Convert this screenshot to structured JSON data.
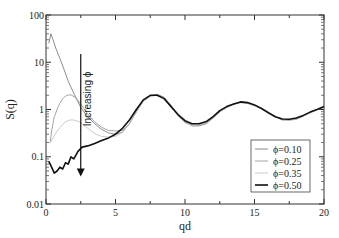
{
  "chart_data": {
    "type": "line",
    "title": "",
    "xlabel": "qd",
    "ylabel": "S(q)",
    "xlim": [
      0,
      20
    ],
    "ylim": [
      0.01,
      100
    ],
    "yscale": "log",
    "grid": false,
    "x_ticks": [
      0,
      5,
      10,
      15,
      20
    ],
    "x_tick_labels": [
      "0",
      "5",
      "10",
      "15",
      "20"
    ],
    "y_ticks": [
      0.01,
      0.1,
      1,
      10,
      100
    ],
    "y_tick_labels": [
      "0.01",
      "0.1",
      "1",
      "10",
      "100"
    ],
    "legend_position": "bottom-right",
    "annotation": {
      "text": "Increasing ϕ",
      "arrow_x": 2.5,
      "arrow_from": 15,
      "arrow_to": 0.04
    },
    "series": [
      {
        "name": "ϕ=0.10",
        "color": "#808080",
        "points": [
          [
            0.2,
            25
          ],
          [
            0.35,
            40
          ],
          [
            0.5,
            30
          ],
          [
            0.7,
            20
          ],
          [
            1.0,
            12
          ],
          [
            1.3,
            7
          ],
          [
            1.6,
            4
          ],
          [
            2.0,
            2.2
          ],
          [
            2.5,
            1.1
          ],
          [
            3.0,
            0.7
          ],
          [
            3.5,
            0.5
          ],
          [
            4.0,
            0.38
          ],
          [
            4.5,
            0.32
          ],
          [
            5.0,
            0.3
          ],
          [
            5.5,
            0.33
          ],
          [
            6.0,
            0.5
          ],
          [
            6.5,
            0.9
          ],
          [
            7.0,
            1.5
          ],
          [
            7.5,
            1.95
          ],
          [
            8.0,
            2.1
          ],
          [
            8.5,
            1.8
          ],
          [
            9.0,
            1.2
          ],
          [
            9.5,
            0.75
          ],
          [
            10.0,
            0.55
          ],
          [
            10.5,
            0.45
          ],
          [
            11.0,
            0.45
          ],
          [
            11.5,
            0.5
          ],
          [
            12.0,
            0.65
          ],
          [
            12.5,
            0.9
          ],
          [
            13.0,
            1.1
          ],
          [
            13.5,
            1.3
          ],
          [
            14.0,
            1.45
          ],
          [
            14.5,
            1.35
          ],
          [
            15.0,
            1.25
          ],
          [
            15.5,
            1.05
          ],
          [
            16.0,
            0.85
          ],
          [
            16.5,
            0.7
          ],
          [
            17.0,
            0.6
          ],
          [
            17.5,
            0.6
          ],
          [
            18.0,
            0.62
          ],
          [
            18.5,
            0.72
          ],
          [
            19.0,
            0.85
          ],
          [
            19.5,
            1.0
          ],
          [
            20.0,
            1.15
          ]
        ]
      },
      {
        "name": "ϕ=0.25",
        "color": "#9a9a9a",
        "points": [
          [
            0.3,
            0.2
          ],
          [
            0.4,
            0.35
          ],
          [
            0.6,
            0.7
          ],
          [
            0.9,
            1.2
          ],
          [
            1.2,
            1.7
          ],
          [
            1.5,
            2.0
          ],
          [
            1.8,
            2.05
          ],
          [
            2.1,
            1.8
          ],
          [
            2.5,
            1.3
          ],
          [
            3.0,
            0.8
          ],
          [
            3.5,
            0.55
          ],
          [
            4.0,
            0.42
          ],
          [
            4.5,
            0.36
          ],
          [
            5.0,
            0.35
          ],
          [
            5.5,
            0.36
          ],
          [
            6.0,
            0.5
          ],
          [
            6.5,
            0.9
          ],
          [
            7.0,
            1.5
          ],
          [
            7.5,
            1.9
          ],
          [
            8.0,
            2.05
          ],
          [
            8.5,
            1.8
          ],
          [
            9.0,
            1.2
          ],
          [
            9.5,
            0.75
          ],
          [
            10.0,
            0.55
          ],
          [
            10.5,
            0.47
          ],
          [
            11.0,
            0.46
          ],
          [
            11.5,
            0.5
          ],
          [
            12.0,
            0.65
          ],
          [
            12.5,
            0.9
          ],
          [
            13.0,
            1.1
          ],
          [
            13.5,
            1.3
          ],
          [
            14.0,
            1.4
          ],
          [
            14.5,
            1.35
          ],
          [
            15.0,
            1.2
          ],
          [
            15.5,
            1.05
          ],
          [
            16.0,
            0.85
          ],
          [
            16.5,
            0.7
          ],
          [
            17.0,
            0.62
          ],
          [
            17.5,
            0.6
          ],
          [
            18.0,
            0.63
          ],
          [
            18.5,
            0.72
          ],
          [
            19.0,
            0.85
          ],
          [
            19.5,
            1.0
          ],
          [
            20.0,
            1.1
          ]
        ]
      },
      {
        "name": "ϕ=0.35",
        "color": "#c4c4c4",
        "points": [
          [
            0.3,
            0.2
          ],
          [
            0.5,
            0.25
          ],
          [
            0.8,
            0.35
          ],
          [
            1.1,
            0.45
          ],
          [
            1.4,
            0.55
          ],
          [
            1.7,
            0.6
          ],
          [
            2.0,
            0.6
          ],
          [
            2.4,
            0.55
          ],
          [
            2.8,
            0.45
          ],
          [
            3.2,
            0.36
          ],
          [
            3.6,
            0.3
          ],
          [
            4.0,
            0.27
          ],
          [
            4.5,
            0.26
          ],
          [
            5.0,
            0.27
          ],
          [
            5.5,
            0.33
          ],
          [
            6.0,
            0.5
          ],
          [
            6.5,
            0.9
          ],
          [
            7.0,
            1.5
          ],
          [
            7.5,
            1.9
          ],
          [
            8.0,
            2.0
          ],
          [
            8.5,
            1.75
          ],
          [
            9.0,
            1.15
          ],
          [
            9.5,
            0.72
          ],
          [
            10.0,
            0.52
          ],
          [
            10.5,
            0.46
          ],
          [
            11.0,
            0.47
          ],
          [
            11.5,
            0.52
          ],
          [
            12.0,
            0.68
          ],
          [
            12.5,
            0.9
          ],
          [
            13.0,
            1.1
          ],
          [
            13.5,
            1.3
          ],
          [
            14.0,
            1.4
          ],
          [
            14.5,
            1.35
          ],
          [
            15.0,
            1.2
          ],
          [
            15.5,
            1.05
          ],
          [
            16.0,
            0.85
          ],
          [
            16.5,
            0.7
          ],
          [
            17.0,
            0.62
          ],
          [
            17.5,
            0.6
          ],
          [
            18.0,
            0.64
          ],
          [
            18.5,
            0.73
          ],
          [
            19.0,
            0.86
          ],
          [
            19.5,
            1.0
          ],
          [
            20.0,
            1.1
          ]
        ]
      },
      {
        "name": "ϕ=0.50",
        "color": "#111111",
        "points": [
          [
            0.2,
            0.08
          ],
          [
            0.4,
            0.06
          ],
          [
            0.6,
            0.045
          ],
          [
            0.8,
            0.05
          ],
          [
            1.0,
            0.06
          ],
          [
            1.2,
            0.055
          ],
          [
            1.4,
            0.075
          ],
          [
            1.6,
            0.07
          ],
          [
            1.8,
            0.1
          ],
          [
            2.0,
            0.09
          ],
          [
            2.3,
            0.13
          ],
          [
            2.6,
            0.16
          ],
          [
            3.0,
            0.17
          ],
          [
            3.5,
            0.19
          ],
          [
            4.0,
            0.22
          ],
          [
            4.5,
            0.25
          ],
          [
            5.0,
            0.3
          ],
          [
            5.5,
            0.4
          ],
          [
            6.0,
            0.6
          ],
          [
            6.5,
            1.0
          ],
          [
            7.0,
            1.6
          ],
          [
            7.5,
            2.0
          ],
          [
            8.0,
            2.0
          ],
          [
            8.5,
            1.7
          ],
          [
            9.0,
            1.15
          ],
          [
            9.5,
            0.78
          ],
          [
            10.0,
            0.58
          ],
          [
            10.5,
            0.5
          ],
          [
            11.0,
            0.5
          ],
          [
            11.5,
            0.55
          ],
          [
            12.0,
            0.7
          ],
          [
            12.5,
            0.95
          ],
          [
            13.0,
            1.15
          ],
          [
            13.5,
            1.3
          ],
          [
            14.0,
            1.45
          ],
          [
            14.5,
            1.4
          ],
          [
            15.0,
            1.25
          ],
          [
            15.5,
            1.05
          ],
          [
            16.0,
            0.85
          ],
          [
            16.5,
            0.7
          ],
          [
            17.0,
            0.63
          ],
          [
            17.5,
            0.62
          ],
          [
            18.0,
            0.66
          ],
          [
            18.5,
            0.75
          ],
          [
            19.0,
            0.88
          ],
          [
            19.5,
            1.0
          ],
          [
            20.0,
            1.15
          ]
        ]
      }
    ]
  }
}
